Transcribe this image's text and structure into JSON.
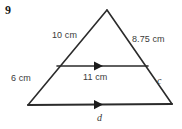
{
  "problem": {
    "number": "9"
  },
  "figure": {
    "type": "triangle-with-midsegment",
    "stroke_color": "#2b2b2b",
    "label_color": "#3a3a3a",
    "background_color": "#ffffff",
    "vertices": {
      "apex": {
        "x": 107,
        "y": 10
      },
      "bottom_left": {
        "x": 28,
        "y": 105
      },
      "bottom_right": {
        "x": 172,
        "y": 104
      }
    },
    "midsegment": {
      "left": {
        "x": 57,
        "y": 66
      },
      "right": {
        "x": 148,
        "y": 66
      },
      "arrow_x": 100
    },
    "base": {
      "arrow_x": 100
    }
  },
  "labels": {
    "left_side_upper": "10 cm",
    "right_side_upper": "8.75 cm",
    "left_side_lower": "6 cm",
    "midsegment": "11 cm",
    "right_side_lower": "c",
    "base": "d"
  },
  "icons": {
    "arrow_marker": "parallel-arrow-marker"
  }
}
